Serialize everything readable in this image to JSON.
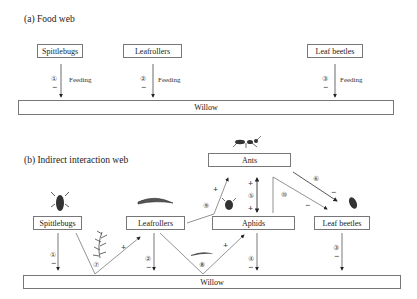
{
  "panel_a": {
    "title": "(a) Food web",
    "nodes": {
      "spittlebugs": "Spittlebugs",
      "leafrollers": "Leafrollers",
      "leaf_beetles": "Leaf beetles",
      "willow": "Willow"
    },
    "edges": [
      {
        "id": "①",
        "from": "Spittlebugs",
        "to": "Willow",
        "sign": "−",
        "label": "Feeding"
      },
      {
        "id": "②",
        "from": "Leafrollers",
        "to": "Willow",
        "sign": "−",
        "label": "Feeding"
      },
      {
        "id": "③",
        "from": "Leaf beetles",
        "to": "Willow",
        "sign": "−",
        "label": "Feeding"
      }
    ]
  },
  "panel_b": {
    "title": "(b) Indirect interaction web",
    "nodes": {
      "ants": "Ants",
      "spittlebugs": "Spittlebugs",
      "leafrollers": "Leafrollers",
      "aphids": "Aphids",
      "leaf_beetles": "Leaf beetles",
      "willow": "Willow"
    },
    "edges": [
      {
        "id": "①",
        "from": "Spittlebugs",
        "to": "Willow",
        "sign": "−"
      },
      {
        "id": "②",
        "from": "Leafrollers",
        "to": "Willow",
        "sign": "−"
      },
      {
        "id": "③",
        "from": "Leaf beetles",
        "to": "Willow",
        "sign": "−"
      },
      {
        "id": "④",
        "from": "Aphids",
        "to": "Willow",
        "sign": "−"
      },
      {
        "id": "⑤",
        "from": "Ants",
        "to": "Aphids",
        "sign_top": "+",
        "sign_bottom": "+"
      },
      {
        "id": "⑥",
        "from": "Ants",
        "to": "Leaf beetles",
        "sign": "−"
      },
      {
        "id": "⑦",
        "from": "Spittlebugs",
        "to": "Leafrollers",
        "via": "Willow",
        "sign": "+"
      },
      {
        "id": "⑧",
        "from": "Leafrollers",
        "to": "Aphids",
        "via": "Willow",
        "sign": "+"
      },
      {
        "id": "⑨",
        "from": "Leafrollers",
        "to": "Ants",
        "via": "Aphids",
        "sign": "+"
      },
      {
        "id": "⑩",
        "from": "Aphids",
        "to": "Leaf beetles",
        "via": "Ants",
        "sign": "−"
      }
    ]
  }
}
